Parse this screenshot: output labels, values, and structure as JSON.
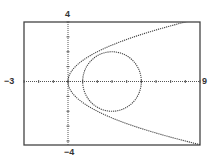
{
  "chart_data": {
    "type": "line",
    "title": "",
    "xlabel": "",
    "ylabel": "",
    "xlim": [
      -3,
      9
    ],
    "ylim": [
      -4,
      4
    ],
    "x_tick_step": 1,
    "y_tick_step": 1,
    "grid": false,
    "legend": null,
    "tick_labels": {
      "xmin": "-3",
      "xmax": "9",
      "ymin": "-4",
      "ymax": "4"
    },
    "series": [
      {
        "name": "circle",
        "equation": "(x-3)^2 + y^2 = 4",
        "kind": "circle",
        "center": [
          3,
          0
        ],
        "radius": 2,
        "style": "dotted"
      },
      {
        "name": "parabola",
        "equation": "y^2 = 2x",
        "kind": "parabola",
        "vertex": [
          0,
          0
        ],
        "opens": "right",
        "points": [
          [
            0,
            0
          ],
          [
            0.5,
            1
          ],
          [
            2,
            2
          ],
          [
            4.5,
            3
          ],
          [
            8,
            4
          ],
          [
            0.5,
            -1
          ],
          [
            2,
            -2
          ],
          [
            4.5,
            -3
          ],
          [
            8,
            -4
          ]
        ],
        "style": "dotted"
      }
    ]
  },
  "labels": {
    "xmin": "−3",
    "xmax": "9",
    "ymax": "4",
    "ymin": "−4"
  },
  "colors": {
    "axis": "#555555",
    "curve": "#444444",
    "frame": "#444444"
  }
}
